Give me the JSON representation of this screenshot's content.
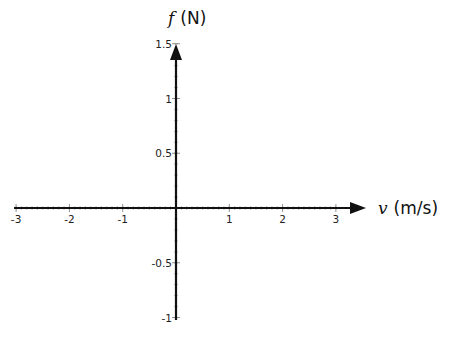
{
  "chart_data": {
    "type": "line",
    "title": "",
    "xlabel": "v (m/s)",
    "ylabel": "f (N)",
    "x_axis": {
      "variable": "v",
      "unit": "(m/s)",
      "range": [
        -3,
        3
      ],
      "ticks": [
        -3,
        -2,
        -1,
        0,
        1,
        2,
        3
      ],
      "tick_labels": [
        "-3",
        "-2",
        "-1",
        "",
        "1",
        "2",
        "3"
      ]
    },
    "y_axis": {
      "variable": "f",
      "unit": "(N)",
      "range": [
        -1,
        1.5
      ],
      "ticks": [
        -1,
        -0.5,
        0,
        0.5,
        1,
        1.5
      ],
      "tick_labels": [
        "-1",
        "-0.5",
        "",
        "0.5",
        "1",
        "1.5"
      ]
    },
    "series": [],
    "grid": false,
    "legend": null
  },
  "colors": {
    "axis": "#111111",
    "background": "#ffffff",
    "text": "#222222"
  }
}
